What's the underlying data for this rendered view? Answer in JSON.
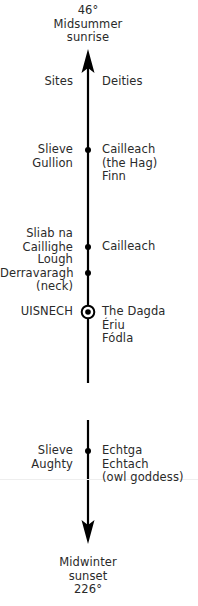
{
  "top": {
    "lines": [
      "46°",
      "Midsummer",
      "sunrise"
    ]
  },
  "bottom": {
    "lines": [
      "Midwinter",
      "sunset",
      "226°"
    ]
  },
  "headers": {
    "left": "Sites",
    "right": "Deities"
  },
  "entries": [
    {
      "site": [
        "Slieve",
        "Gullion"
      ],
      "deities": [
        "Cailleach",
        "(the Hag)",
        "Finn"
      ],
      "marker": "dot"
    },
    {
      "site": [
        "Sliab na",
        "Caillighe"
      ],
      "deities": [
        "Cailleach"
      ],
      "marker": "dot"
    },
    {
      "site": [
        "Lough",
        "Derravaragh",
        "(neck)"
      ],
      "deities": [],
      "marker": "dot"
    },
    {
      "site": [
        "UISNECH"
      ],
      "deities": [
        "The Dagda",
        "Ériu",
        "Fódla"
      ],
      "marker": "circled-dot"
    },
    {
      "site": [
        "Slieve",
        "Aughty"
      ],
      "deities": [
        "Echtga",
        "Echtach",
        "(owl goddess)"
      ],
      "marker": "dot"
    }
  ],
  "colors": {
    "ink": "#000000",
    "text": "#2a2a2a",
    "background": "#ffffff"
  }
}
